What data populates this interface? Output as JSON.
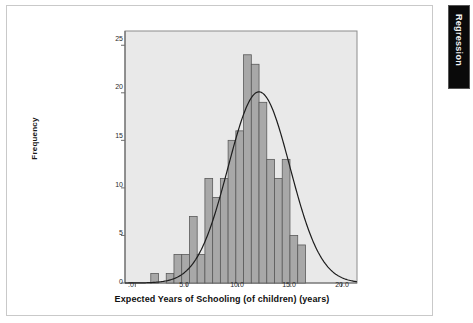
{
  "window": {
    "title": "Regression"
  },
  "nav_tab": {
    "label": "Regression",
    "color": "#0a0a0a",
    "text_color": "#f2f2f2"
  },
  "page": {
    "background": "#ffffff",
    "border_color": "#c9c9c9"
  },
  "chart_data": {
    "type": "bar",
    "subtype": "histogram",
    "title": "",
    "subtitle": "",
    "xlabel": "Expected Years of Schooling (of children) (years)",
    "ylabel": "Frequency",
    "xlim": [
      -1.0,
      21.5
    ],
    "ylim": [
      0,
      26.5
    ],
    "xticks": [
      0,
      5,
      10,
      15,
      20
    ],
    "xtick_labels": [
      ".0",
      "5.0",
      "10.0",
      "15.0",
      "20.0"
    ],
    "yticks": [
      0,
      5,
      10,
      15,
      20,
      25
    ],
    "ytick_labels": [
      "0",
      "5",
      "10",
      "15",
      "20",
      "25"
    ],
    "grid": false,
    "legend": false,
    "plot_background": "#e9e9e9",
    "bar_fill": "#a8a8a8",
    "bar_stroke": "#5a5a5a",
    "curve_color": "#1d1d1d",
    "axis_color": "#6e6e6e",
    "bin_width": 0.75,
    "bin_starts": [
      1.5,
      2.25,
      3.0,
      3.75,
      4.5,
      5.25,
      6.0,
      6.75,
      7.5,
      8.25,
      9.0,
      9.75,
      10.5,
      11.25,
      12.0,
      12.75,
      13.5,
      14.25,
      15.0,
      15.75,
      16.5,
      17.25,
      18.0
    ],
    "categories": [
      "1.5",
      "2.25",
      "3.0",
      "3.75",
      "4.5",
      "5.25",
      "6.0",
      "6.75",
      "7.5",
      "8.25",
      "9.0",
      "9.75",
      "10.5",
      "11.25",
      "12.0",
      "12.75",
      "13.5",
      "14.25",
      "15.0",
      "15.75",
      "16.5",
      "17.25",
      "18.0"
    ],
    "values": [
      1,
      0,
      1,
      3,
      3,
      7,
      3,
      11,
      9,
      11,
      15,
      16,
      24,
      23,
      19,
      13,
      11,
      13,
      5,
      4,
      0,
      0,
      0
    ],
    "normal_curve": {
      "mean": 12.0,
      "sd": 3.0,
      "peak_value": 20.1,
      "description": "normal distribution overlay"
    }
  }
}
